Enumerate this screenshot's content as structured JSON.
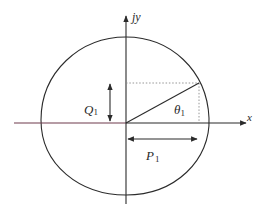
{
  "diagram": {
    "type": "phasor-ellipse",
    "axes": {
      "x_label": "x",
      "y_label": "jy"
    },
    "labels": {
      "q_label": "Q",
      "q_sub": "1",
      "p_label": "P",
      "p_sub": "1",
      "theta_label": "θ",
      "theta_sub": "1"
    },
    "colors": {
      "line": "#2b2b2b",
      "dotted": "#8a8a8a",
      "x_axis_left_tint": "#7a3a50",
      "background": "#ffffff"
    },
    "elements": [
      "closed curve (ellipse-like) centered on origin",
      "x axis with arrow",
      "jy axis with arrow",
      "radius line from origin to point on curve at angle theta1",
      "dotted projection lines to axes",
      "double-headed arrow Q1 (vertical component)",
      "double-headed arrow P1 (horizontal component)"
    ]
  }
}
